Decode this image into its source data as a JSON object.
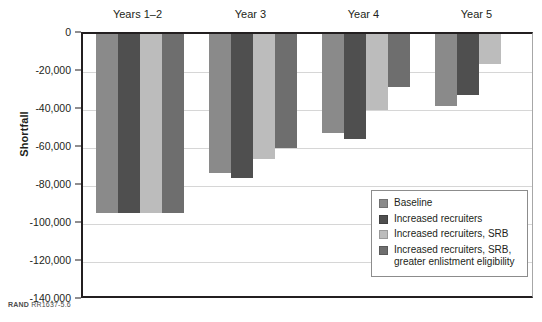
{
  "figure": {
    "credit_brand": "RAND",
    "credit_id": "RR1637-5.6"
  },
  "chart_data": {
    "type": "bar",
    "title": "",
    "xlabel": "",
    "ylabel": "Shortfall",
    "ylim": [
      -140000,
      0
    ],
    "ytick_values": [
      0,
      -20000,
      -40000,
      -60000,
      -80000,
      -100000,
      -120000,
      -140000
    ],
    "ytick_labels": [
      "0",
      "-20,000",
      "-40,000",
      "-60,000",
      "-80,000",
      "-100,000",
      "-120,000",
      "-140,000"
    ],
    "grid": true,
    "legend_position": "inside-bottom-right",
    "categories": [
      "Years 1–2",
      "Year 3",
      "Year 4",
      "Year 5"
    ],
    "series": [
      {
        "name": "Baseline",
        "color": "#8a8a8a",
        "values": [
          -94000,
          -73000,
          -52000,
          -38000
        ]
      },
      {
        "name": "Increased recruiters",
        "color": "#4f4f4f",
        "values": [
          -94000,
          -76000,
          -55000,
          -32000
        ]
      },
      {
        "name": "Increased recruiters, SRB",
        "color": "#bcbcbc",
        "values": [
          -94000,
          -66000,
          -40000,
          -16000
        ]
      },
      {
        "name": "Increased recruiters, SRB, greater enlistment eligibility",
        "color": "#6e6e6e",
        "values": [
          -94000,
          -60000,
          -28000,
          0
        ]
      }
    ]
  }
}
